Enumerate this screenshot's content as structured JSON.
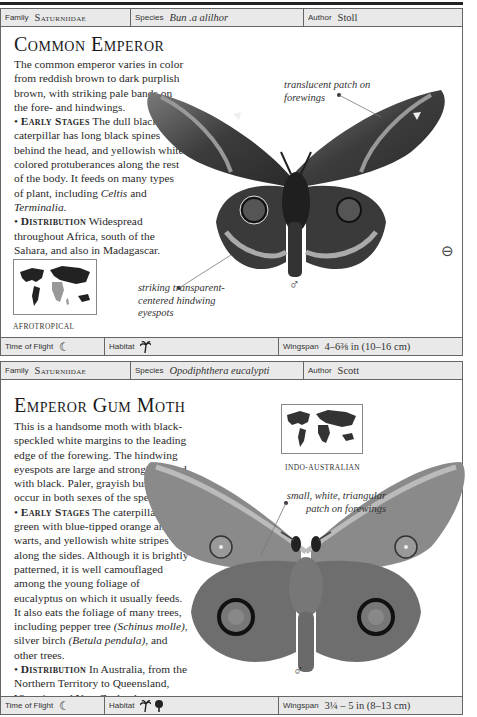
{
  "cards": [
    {
      "family_label": "Family",
      "family_value": "Saturniidae",
      "species_label": "Species",
      "species_value": "Bun .a alilhor",
      "author_label": "Author",
      "author_value": "Stoll",
      "title": "Common Emperor",
      "intro": "The common emperor varies in color from reddish brown to dark purplish brown, with striking pale bands on the fore- and hindwings.",
      "early_heading": "Early Stages",
      "early_text_1": " The dull black caterpillar has long black spines behind the head, and yellowish white colored protuberances along the rest of the body. It feeds on many types of plant, including ",
      "early_italic_1": "Celtis",
      "early_text_2": " and ",
      "early_italic_2": "Terminalia",
      "early_text_3": ".",
      "dist_heading": "Distribution",
      "dist_text": " Widespread throughout Africa, south of the Sahara, and also in Madagascar.",
      "map_label": "AFROTROPICAL",
      "callout_1": "translucent patch on forewings",
      "callout_2": "striking transparent-centered hindwing eyespots",
      "sex_symbol": "♂",
      "zoom_icon": "zoom-out-icon",
      "flight_label": "Time of Flight",
      "flight_icon": "moon-icon",
      "habitat_label": "Habitat",
      "habitat_icons": [
        "palm-tree-icon"
      ],
      "wingspan_label": "Wingspan",
      "wingspan_value": "4–6⅜ in (10–16 cm)"
    },
    {
      "family_label": "Family",
      "family_value": "Saturniidae",
      "species_label": "Species",
      "species_value": "Opodiphthera eucalypti",
      "author_label": "Author",
      "author_value": "Scott",
      "title": "Emperor Gum Moth",
      "intro": "This is a handsome moth with black-speckled white margins to the leading edge of the forewing. The hindwing eyespots are large and strongly ringed with black. Paler, grayish buff forms occur in both sexes of the species.",
      "early_heading": "Early Stages",
      "early_text_1": " The caterpillar is green with blue-tipped orange and red warts, and yellowish white stripes along the sides. Although it is brightly patterned, it is well camouflaged among the young foliage of eucalyptus on which it usually feeds. It also eats the foliage of many trees, including pepper tree ",
      "early_italic_1": "(Schinus molle)",
      "early_text_2": ", silver birch ",
      "early_italic_2": "(Betula pendula)",
      "early_text_3": ", and other trees.",
      "dist_heading": "Distribution",
      "dist_text": " In Australia, from the Northern Territory to Queensland, Victoria, and New Zealand.",
      "map_label": "INDO-AUSTRALIAN",
      "callout_1": "small, white, triangular patch on forewings",
      "sex_symbol": "♂",
      "flight_label": "Time of Flight",
      "flight_icon": "moon-icon",
      "habitat_label": "Habitat",
      "habitat_icons": [
        "palm-tree-icon",
        "deciduous-tree-icon"
      ],
      "wingspan_label": "Wingspan",
      "wingspan_value": "3¼ – 5 in (8–13 cm)"
    }
  ],
  "icons": {
    "moon": "☾",
    "palm": "🌴",
    "tree": "♣",
    "zoom": "⊖"
  }
}
